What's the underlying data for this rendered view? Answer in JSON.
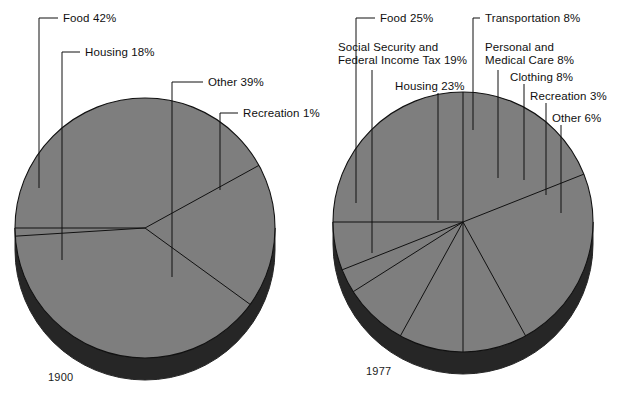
{
  "figure": {
    "background": "#ffffff",
    "pie_face_color": "#7e7e7e",
    "pie_side_color": "#262626",
    "outline_color": "#111111"
  },
  "charts": [
    {
      "id": "pie-1900",
      "year_label": "1900",
      "center": [
        145,
        228
      ],
      "radius": 130,
      "depth": 22,
      "start_angle": 180,
      "chart_type": "pie",
      "slices": [
        {
          "name": "Food",
          "label": "Food 42%",
          "value": 42
        },
        {
          "name": "Housing",
          "label": "Housing 18%",
          "value": 18
        },
        {
          "name": "Other",
          "label": "Other 39%",
          "value": 39
        },
        {
          "name": "Recreation",
          "label": "Recreation 1%",
          "value": 1
        }
      ],
      "labels": [
        {
          "name": "food",
          "text": "Food 42%",
          "x": 63,
          "y": 12,
          "lead_x": 39,
          "lead_y0": 18,
          "lead_y1": 188,
          "elbow_x": 58
        },
        {
          "name": "housing",
          "text": "Housing 18%",
          "x": 85,
          "y": 46,
          "lead_x": 62,
          "lead_y0": 52,
          "lead_y1": 260,
          "elbow_x": 80
        },
        {
          "name": "other",
          "text": "Other 39%",
          "x": 208,
          "y": 76,
          "lead_x": 172,
          "lead_y0": 82,
          "lead_y1": 277,
          "elbow_x": 203
        },
        {
          "name": "recreation",
          "text": "Recreation 1%",
          "x": 243,
          "y": 107,
          "lead_x": 220,
          "lead_y0": 113,
          "lead_y1": 190,
          "elbow_x": 238
        }
      ]
    },
    {
      "id": "pie-1977",
      "year_label": "1977",
      "center": [
        463,
        222
      ],
      "radius": 130,
      "depth": 22,
      "start_angle": 180,
      "chart_type": "pie",
      "slices": [
        {
          "name": "Food",
          "label": "Food 25%",
          "value": 25
        },
        {
          "name": "Social Security and Federal Income Tax",
          "label": "Social Security and\nFederal Income Tax 19%",
          "value": 19
        },
        {
          "name": "Housing",
          "label": "Housing 23%",
          "value": 23
        },
        {
          "name": "Transportation",
          "label": "Transportation 8%",
          "value": 8
        },
        {
          "name": "Personal and Medical Care",
          "label": "Personal and\nMedical Care 8%",
          "value": 8
        },
        {
          "name": "Clothing",
          "label": "Clothing 8%",
          "value": 8
        },
        {
          "name": "Recreation",
          "label": "Recreation 3%",
          "value": 3
        },
        {
          "name": "Other",
          "label": "Other 6%",
          "value": 6
        }
      ],
      "labels": [
        {
          "name": "food",
          "text": "Food 25%",
          "x": 380,
          "y": 12,
          "lead_x": 356,
          "lead_y0": 18,
          "lead_y1": 203,
          "elbow_x": 375
        },
        {
          "name": "social-tax",
          "text": "Social Security and\nFederal Income Tax 19%",
          "x": 338,
          "y": 41,
          "lead_x": 372,
          "lead_y0": 70,
          "lead_y1": 253,
          "elbow_x": 372
        },
        {
          "name": "housing",
          "text": "Housing 23%",
          "x": 395,
          "y": 80,
          "lead_x": 438,
          "lead_y0": 93,
          "lead_y1": 220,
          "elbow_x": 438
        },
        {
          "name": "transportation",
          "text": "Transportation 8%",
          "x": 485,
          "y": 12,
          "lead_x": 473,
          "lead_y0": 18,
          "lead_y1": 130,
          "elbow_x": 480
        },
        {
          "name": "personal-med",
          "text": "Personal and\nMedical Care 8%",
          "x": 485,
          "y": 41,
          "lead_x": 498,
          "lead_y0": 70,
          "lead_y1": 178,
          "elbow_x": 498
        },
        {
          "name": "clothing",
          "text": "Clothing 8%",
          "x": 510,
          "y": 71,
          "lead_x": 524,
          "lead_y0": 84,
          "lead_y1": 180,
          "elbow_x": 524
        },
        {
          "name": "recreation",
          "text": "Recreation 3%",
          "x": 530,
          "y": 90,
          "lead_x": 546,
          "lead_y0": 103,
          "lead_y1": 195,
          "elbow_x": 546
        },
        {
          "name": "other",
          "text": "Other 6%",
          "x": 552,
          "y": 112,
          "lead_x": 561,
          "lead_y0": 125,
          "lead_y1": 213,
          "elbow_x": 561
        }
      ]
    }
  ],
  "chart_data": [
    {
      "type": "pie",
      "title": "1900",
      "categories": [
        "Food",
        "Housing",
        "Other",
        "Recreation"
      ],
      "values": [
        42,
        18,
        39,
        1
      ],
      "unit": "percent",
      "labels": [
        "Food 42%",
        "Housing 18%",
        "Other 39%",
        "Recreation 1%"
      ],
      "legend": "none",
      "annotations": [
        "1900"
      ]
    },
    {
      "type": "pie",
      "title": "1977",
      "categories": [
        "Food",
        "Social Security and Federal Income Tax",
        "Housing",
        "Transportation",
        "Personal and Medical Care",
        "Clothing",
        "Recreation",
        "Other"
      ],
      "values": [
        25,
        19,
        23,
        8,
        8,
        8,
        3,
        6
      ],
      "unit": "percent",
      "labels": [
        "Food 25%",
        "Social Security and Federal Income Tax 19%",
        "Housing 23%",
        "Transportation 8%",
        "Personal and Medical Care 8%",
        "Clothing 8%",
        "Recreation 3%",
        "Other 6%"
      ],
      "legend": "none",
      "annotations": [
        "1977"
      ]
    }
  ]
}
